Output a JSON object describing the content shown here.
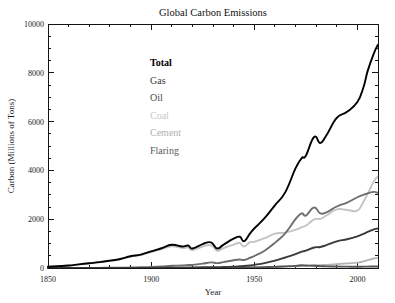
{
  "chart_data": {
    "type": "line",
    "title": "Global Carbon Emissions",
    "xlabel": "Year",
    "ylabel": "Carbon (Millions of Tons)",
    "xlim": [
      1850,
      2010
    ],
    "ylim": [
      0,
      10000
    ],
    "xticks": [
      1850,
      1900,
      1950,
      2000
    ],
    "yticks": [
      0,
      2000,
      4000,
      6000,
      8000,
      10000
    ],
    "xtick_labels": [
      "1850",
      "1900",
      "1950",
      "2000"
    ],
    "ytick_labels": [
      "0",
      "2000",
      "4000",
      "6000",
      "8000",
      "10000"
    ],
    "x_minor_interval": 10,
    "y_minor_interval": 500,
    "grid": false,
    "legend_position": "upper-left-inside",
    "x": [
      1850,
      1855,
      1860,
      1865,
      1870,
      1875,
      1880,
      1885,
      1890,
      1895,
      1900,
      1905,
      1910,
      1915,
      1918,
      1920,
      1925,
      1929,
      1932,
      1935,
      1940,
      1943,
      1945,
      1948,
      1950,
      1955,
      1960,
      1965,
      1970,
      1973,
      1975,
      1979,
      1982,
      1985,
      1990,
      1995,
      2000,
      2003,
      2005,
      2008,
      2010
    ],
    "series": [
      {
        "name": "Total",
        "color": "#000000",
        "width": 1.9,
        "values": [
          54,
          76,
          100,
          148,
          195,
          240,
          300,
          370,
          480,
          550,
          680,
          810,
          950,
          880,
          920,
          800,
          980,
          1050,
          800,
          950,
          1200,
          1280,
          1100,
          1420,
          1620,
          2040,
          2570,
          3100,
          4080,
          4500,
          4600,
          5370,
          5120,
          5440,
          6150,
          6400,
          6800,
          7420,
          8080,
          8800,
          9150
        ]
      },
      {
        "name": "Coal",
        "color": "#c4c4c4",
        "width": 1.9,
        "values": [
          54,
          76,
          100,
          147,
          193,
          236,
          295,
          360,
          465,
          530,
          650,
          770,
          890,
          820,
          850,
          730,
          880,
          930,
          700,
          810,
          960,
          1030,
          880,
          1060,
          1070,
          1220,
          1410,
          1450,
          1560,
          1680,
          1730,
          1990,
          2010,
          2150,
          2400,
          2380,
          2350,
          2730,
          3050,
          3550,
          3750
        ]
      },
      {
        "name": "Oil",
        "color": "#6e6e6e",
        "width": 1.9,
        "values": [
          0,
          0,
          1,
          2,
          4,
          6,
          10,
          14,
          20,
          28,
          40,
          60,
          90,
          100,
          120,
          130,
          180,
          230,
          200,
          240,
          320,
          350,
          330,
          420,
          490,
          710,
          1030,
          1420,
          2000,
          2240,
          2150,
          2480,
          2240,
          2280,
          2520,
          2680,
          2900,
          3000,
          3060,
          3120,
          3080
        ]
      },
      {
        "name": "Gas",
        "color": "#3a3a3a",
        "width": 1.9,
        "values": [
          0,
          0,
          0,
          0,
          0,
          0,
          0,
          1,
          2,
          3,
          5,
          8,
          12,
          15,
          18,
          20,
          28,
          36,
          30,
          38,
          55,
          70,
          80,
          105,
          130,
          200,
          300,
          430,
          570,
          670,
          710,
          840,
          860,
          940,
          1090,
          1180,
          1300,
          1400,
          1480,
          1580,
          1620
        ]
      },
      {
        "name": "Cement",
        "color": "#b5b5b5",
        "width": 1.9,
        "values": [
          0,
          0,
          0,
          0,
          0,
          0,
          0,
          0,
          1,
          1,
          2,
          3,
          5,
          5,
          5,
          5,
          8,
          11,
          8,
          10,
          14,
          12,
          10,
          15,
          18,
          28,
          40,
          55,
          73,
          85,
          88,
          110,
          115,
          130,
          160,
          190,
          220,
          270,
          320,
          390,
          420
        ]
      },
      {
        "name": "Flaring",
        "color": "#545454",
        "width": 1.9,
        "values": [
          0,
          0,
          0,
          0,
          0,
          0,
          0,
          0,
          0,
          0,
          0,
          0,
          1,
          1,
          2,
          2,
          3,
          5,
          5,
          6,
          10,
          12,
          14,
          18,
          23,
          35,
          48,
          68,
          87,
          110,
          100,
          90,
          75,
          65,
          60,
          55,
          50,
          55,
          58,
          62,
          62
        ]
      }
    ]
  },
  "legend": {
    "items": [
      {
        "label": "Total",
        "color": "#000000",
        "weight": "bold"
      },
      {
        "label": "Gas",
        "color": "#3a3a3a",
        "weight": "normal"
      },
      {
        "label": "Oil",
        "color": "#4a4a4a",
        "weight": "normal"
      },
      {
        "label": "Coal",
        "color": "#c8c8c8",
        "weight": "normal"
      },
      {
        "label": "Cement",
        "color": "#b0b0b0",
        "weight": "normal"
      },
      {
        "label": "Flaring",
        "color": "#5a5a5a",
        "weight": "normal"
      }
    ]
  },
  "style": {
    "background": "#ffffff",
    "axis_color": "#151515",
    "text_color": "#1a1a1a"
  }
}
